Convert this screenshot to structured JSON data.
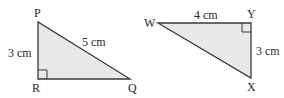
{
  "triangle1": {
    "vertices": {
      "P": "P",
      "R": "R",
      "Q": "Q"
    },
    "sides": {
      "PR": "3 cm",
      "PQ": "5 cm"
    },
    "right_angle_at": "R"
  },
  "triangle2": {
    "vertices": {
      "W": "W",
      "Y": "Y",
      "X": "X"
    },
    "sides": {
      "WY": "4 cm",
      "YX": "3 cm"
    },
    "right_angle_at": "Y"
  },
  "colors": {
    "fill": "#e8e8e8",
    "stroke": "#3a3a3a"
  }
}
